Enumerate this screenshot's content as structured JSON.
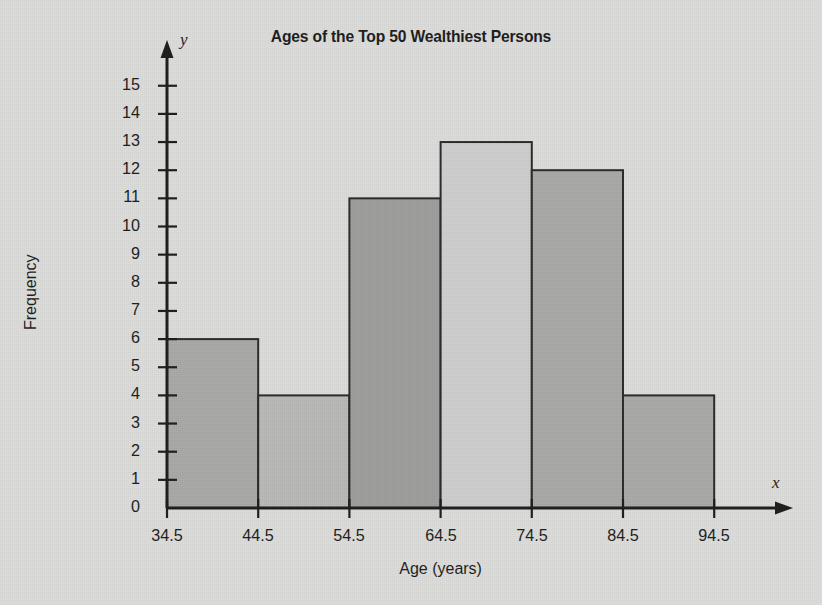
{
  "chart_data": {
    "type": "bar",
    "title": "Ages of the Top 50 Wealthiest Persons",
    "xlabel": "Age (years)",
    "ylabel": "Frequency",
    "x_axis_variable": "x",
    "y_axis_variable": "y",
    "bin_edges": [
      34.5,
      44.5,
      54.5,
      64.5,
      74.5,
      84.5,
      94.5
    ],
    "bin_edge_labels": [
      "34.5",
      "44.5",
      "54.5",
      "64.5",
      "74.5",
      "84.5",
      "94.5"
    ],
    "categories": [
      "34.5-44.5",
      "44.5-54.5",
      "54.5-64.5",
      "64.5-74.5",
      "74.5-84.5",
      "84.5-94.5"
    ],
    "values": [
      6,
      4,
      11,
      13,
      12,
      4
    ],
    "bar_fills": [
      "#a9a9a7",
      "#b9b9b7",
      "#9e9e9c",
      "#cecece",
      "#a9a9a7",
      "#a9a9a7"
    ],
    "ylim": [
      0,
      15
    ],
    "yticks": [
      0,
      1,
      2,
      3,
      4,
      5,
      6,
      7,
      8,
      9,
      10,
      11,
      12,
      13,
      14,
      15
    ],
    "ytick_labels": [
      "0",
      "1",
      "2",
      "3",
      "4",
      "5",
      "6",
      "7",
      "8",
      "9",
      "10",
      "11",
      "12",
      "13",
      "14",
      "15"
    ],
    "grid": false,
    "legend": "none",
    "total_frequency": 50,
    "background_color": "#dcdcda",
    "axis_color": "#1d1d1d",
    "bar_edge_color": "#2a2a2a"
  }
}
